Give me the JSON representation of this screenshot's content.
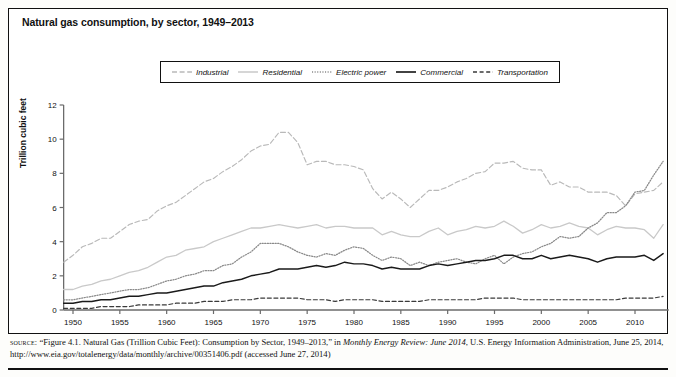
{
  "figure": {
    "title": "Natural gas consumption, by sector, 1949–2013",
    "ylabel": "Trillion cubic feet"
  },
  "legend": {
    "items": [
      {
        "label": "Industrial",
        "style": "long-dash",
        "color": "#b9b9b9",
        "icon": "line-sample-industrial"
      },
      {
        "label": "Residential",
        "style": "solid-light",
        "color": "#c9c9c9",
        "icon": "line-sample-residential"
      },
      {
        "label": "Electric power",
        "style": "dotted",
        "color": "#8a8a8a",
        "icon": "line-sample-electric-power"
      },
      {
        "label": "Commercial",
        "style": "solid-dark",
        "color": "#1a1a1a",
        "icon": "line-sample-commercial"
      },
      {
        "label": "Transportation",
        "style": "dash",
        "color": "#3a3a3a",
        "icon": "line-sample-transportation"
      }
    ]
  },
  "source": {
    "label": "source:",
    "text_part1": "“Figure 4.1. Natural Gas (Trillion Cubic Feet): Consumption by Sector, 1949–2013,” in ",
    "italic1": "Monthly Energy Review: June 2014",
    "text_part2": ", U.S. Energy Information Administration, June 25, 2014, http://www.eia.gov/totalenergy/data/monthly/archive/00351406.pdf (accessed June 27, 2014)"
  },
  "chart_data": {
    "type": "line",
    "title": "Natural gas consumption, by sector, 1949–2013",
    "xlabel": "",
    "ylabel": "Trillion cubic feet",
    "xlim": [
      1949,
      2013
    ],
    "ylim": [
      0,
      12
    ],
    "yticks": [
      0,
      2,
      4,
      6,
      8,
      10,
      12
    ],
    "xticks": [
      1950,
      1955,
      1960,
      1965,
      1970,
      1975,
      1980,
      1985,
      1990,
      1995,
      2000,
      2005,
      2010
    ],
    "grid": false,
    "legend_position": "top-center",
    "x": [
      1949,
      1950,
      1951,
      1952,
      1953,
      1954,
      1955,
      1956,
      1957,
      1958,
      1959,
      1960,
      1961,
      1962,
      1963,
      1964,
      1965,
      1966,
      1967,
      1968,
      1969,
      1970,
      1971,
      1972,
      1973,
      1974,
      1975,
      1976,
      1977,
      1978,
      1979,
      1980,
      1981,
      1982,
      1983,
      1984,
      1985,
      1986,
      1987,
      1988,
      1989,
      1990,
      1991,
      1992,
      1993,
      1994,
      1995,
      1996,
      1997,
      1998,
      1999,
      2000,
      2001,
      2002,
      2003,
      2004,
      2005,
      2006,
      2007,
      2008,
      2009,
      2010,
      2011,
      2012,
      2013
    ],
    "series": [
      {
        "name": "Industrial",
        "style": "long-dash",
        "color": "#b9b9b9",
        "values": [
          2.8,
          3.2,
          3.7,
          3.9,
          4.2,
          4.2,
          4.6,
          5.0,
          5.2,
          5.3,
          5.8,
          6.1,
          6.3,
          6.7,
          7.1,
          7.5,
          7.7,
          8.1,
          8.4,
          8.8,
          9.3,
          9.6,
          9.7,
          10.4,
          10.4,
          9.8,
          8.5,
          8.7,
          8.7,
          8.5,
          8.5,
          8.4,
          8.2,
          7.1,
          6.5,
          6.9,
          6.5,
          6.0,
          6.5,
          7.0,
          7.0,
          7.2,
          7.5,
          7.7,
          8.0,
          8.1,
          8.6,
          8.6,
          8.7,
          8.3,
          8.2,
          8.2,
          7.3,
          7.5,
          7.2,
          7.2,
          6.9,
          6.9,
          6.9,
          6.7,
          6.1,
          6.8,
          6.9,
          7.0,
          7.5
        ]
      },
      {
        "name": "Residential",
        "style": "solid-light",
        "color": "#c9c9c9",
        "values": [
          1.2,
          1.2,
          1.4,
          1.5,
          1.7,
          1.8,
          2.0,
          2.2,
          2.3,
          2.5,
          2.8,
          3.1,
          3.2,
          3.5,
          3.6,
          3.7,
          4.0,
          4.2,
          4.4,
          4.6,
          4.8,
          4.8,
          4.9,
          5.0,
          4.9,
          4.8,
          4.9,
          5.0,
          4.8,
          4.9,
          4.9,
          4.8,
          4.8,
          4.8,
          4.4,
          4.6,
          4.4,
          4.3,
          4.3,
          4.6,
          4.8,
          4.4,
          4.6,
          4.7,
          4.9,
          4.8,
          4.9,
          5.2,
          4.9,
          4.5,
          4.7,
          5.0,
          4.8,
          4.9,
          5.1,
          4.9,
          4.8,
          4.4,
          4.7,
          4.9,
          4.8,
          4.8,
          4.7,
          4.2,
          5.0
        ]
      },
      {
        "name": "Electric power",
        "style": "dotted",
        "color": "#8a8a8a",
        "values": [
          0.6,
          0.6,
          0.7,
          0.8,
          0.9,
          1.0,
          1.1,
          1.2,
          1.2,
          1.3,
          1.5,
          1.7,
          1.8,
          2.0,
          2.1,
          2.3,
          2.3,
          2.6,
          2.7,
          3.1,
          3.4,
          3.9,
          3.9,
          3.9,
          3.7,
          3.4,
          3.2,
          3.1,
          3.3,
          3.2,
          3.5,
          3.7,
          3.6,
          3.2,
          2.9,
          3.1,
          3.0,
          2.6,
          2.8,
          2.6,
          2.8,
          2.9,
          3.0,
          2.8,
          2.7,
          3.0,
          3.2,
          2.7,
          3.1,
          3.3,
          3.4,
          3.7,
          3.9,
          4.3,
          4.2,
          4.3,
          4.8,
          5.1,
          5.7,
          5.7,
          6.1,
          6.9,
          7.0,
          7.9,
          8.7
        ]
      },
      {
        "name": "Commercial",
        "style": "solid-dark",
        "color": "#1a1a1a",
        "values": [
          0.4,
          0.4,
          0.5,
          0.5,
          0.6,
          0.6,
          0.7,
          0.8,
          0.8,
          0.9,
          1.0,
          1.0,
          1.1,
          1.2,
          1.3,
          1.4,
          1.4,
          1.6,
          1.7,
          1.8,
          2.0,
          2.1,
          2.2,
          2.4,
          2.4,
          2.4,
          2.5,
          2.6,
          2.5,
          2.6,
          2.8,
          2.7,
          2.7,
          2.6,
          2.4,
          2.5,
          2.4,
          2.4,
          2.4,
          2.6,
          2.7,
          2.6,
          2.7,
          2.8,
          2.9,
          2.9,
          3.0,
          3.2,
          3.2,
          3.0,
          3.0,
          3.2,
          3.0,
          3.1,
          3.2,
          3.1,
          3.0,
          2.8,
          3.0,
          3.1,
          3.1,
          3.1,
          3.2,
          2.9,
          3.3
        ]
      },
      {
        "name": "Transportation",
        "style": "dash",
        "color": "#3a3a3a",
        "values": [
          0.1,
          0.1,
          0.1,
          0.1,
          0.2,
          0.2,
          0.2,
          0.2,
          0.3,
          0.3,
          0.3,
          0.3,
          0.4,
          0.4,
          0.4,
          0.5,
          0.5,
          0.5,
          0.6,
          0.6,
          0.6,
          0.7,
          0.7,
          0.7,
          0.7,
          0.7,
          0.6,
          0.6,
          0.6,
          0.5,
          0.6,
          0.6,
          0.6,
          0.6,
          0.5,
          0.5,
          0.5,
          0.5,
          0.5,
          0.6,
          0.6,
          0.6,
          0.6,
          0.6,
          0.6,
          0.7,
          0.7,
          0.7,
          0.7,
          0.6,
          0.6,
          0.6,
          0.6,
          0.6,
          0.6,
          0.6,
          0.6,
          0.6,
          0.6,
          0.6,
          0.7,
          0.7,
          0.7,
          0.7,
          0.8
        ]
      }
    ]
  }
}
